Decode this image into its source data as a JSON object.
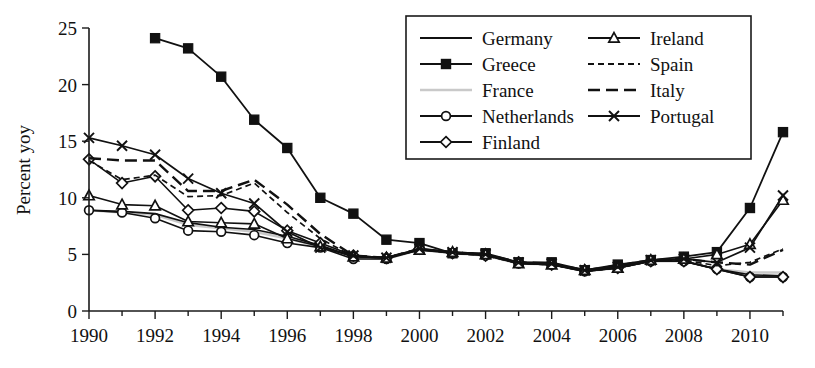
{
  "chart_data": {
    "type": "line",
    "title": "",
    "xlabel": "",
    "ylabel": "Percent yoy",
    "xlim": [
      1990,
      2011
    ],
    "ylim": [
      0,
      25
    ],
    "ytick_step": 5,
    "yticks": [
      0,
      5,
      10,
      15,
      20,
      25
    ],
    "ytick_labels": [
      "0",
      "5",
      "10",
      "15",
      "20",
      "25"
    ],
    "xticks": [
      1990,
      1992,
      1994,
      1996,
      1998,
      2000,
      2002,
      2004,
      2006,
      2008,
      2010
    ],
    "xtick_labels": [
      "1990",
      "1992",
      "1994",
      "1996",
      "1998",
      "2000",
      "2002",
      "2004",
      "2006",
      "2008",
      "2010"
    ],
    "x_minor_ticks": [
      1991,
      1993,
      1995,
      1997,
      1999,
      2001,
      2003,
      2005,
      2007,
      2009,
      2011
    ],
    "grid": false,
    "legend_position": "top-right",
    "x": [
      1990,
      1991,
      1992,
      1993,
      1994,
      1995,
      1996,
      1997,
      1998,
      1999,
      2000,
      2001,
      2002,
      2003,
      2004,
      2005,
      2006,
      2007,
      2008,
      2009,
      2010,
      2011
    ],
    "series": [
      {
        "name": "Germany",
        "marker": "none",
        "dash": "none",
        "color": "#111111",
        "width": 1.7,
        "x": [
          1990,
          1991,
          1992,
          1993,
          1994,
          1995,
          1996,
          1997,
          1998,
          1999,
          2000,
          2001,
          2002,
          2003,
          2004,
          2005,
          2006,
          2007,
          2008,
          2009,
          2010,
          2011
        ],
        "values": [
          8.9,
          8.8,
          8.6,
          7.8,
          7.4,
          7.2,
          6.6,
          5.8,
          4.8,
          4.7,
          5.4,
          5.2,
          5.0,
          4.2,
          4.1,
          3.5,
          3.8,
          4.4,
          4.4,
          3.7,
          3.2,
          3.1
        ]
      },
      {
        "name": "Greece",
        "marker": "square",
        "dash": "none",
        "color": "#111111",
        "width": 1.8,
        "x": [
          1992,
          1993,
          1994,
          1995,
          1996,
          1997,
          1998,
          1999,
          2000,
          2001,
          2002,
          2003,
          2004,
          2005,
          2006,
          2007,
          2008,
          2009,
          2010,
          2011
        ],
        "values": [
          24.1,
          23.2,
          20.7,
          16.9,
          14.4,
          10.0,
          8.6,
          6.3,
          6.0,
          5.1,
          5.1,
          4.3,
          4.3,
          3.6,
          4.1,
          4.5,
          4.8,
          5.2,
          9.1,
          15.8
        ]
      },
      {
        "name": "France",
        "marker": "none",
        "dash": "none",
        "color": "#c9c9c9",
        "width": 2.4,
        "x": [
          1990,
          1991,
          1992,
          1993,
          1994,
          1995,
          1996,
          1997,
          1998,
          1999,
          2000,
          2001,
          2002,
          2003,
          2004,
          2005,
          2006,
          2007,
          2008,
          2009,
          2010,
          2011
        ],
        "values": [
          8.9,
          8.7,
          8.5,
          7.6,
          7.3,
          7.0,
          6.4,
          5.7,
          4.7,
          4.6,
          5.4,
          5.1,
          4.9,
          4.2,
          4.1,
          3.5,
          3.8,
          4.4,
          4.4,
          3.7,
          3.4,
          3.4
        ]
      },
      {
        "name": "Netherlands",
        "marker": "circle",
        "dash": "none",
        "color": "#111111",
        "width": 1.6,
        "x": [
          1990,
          1991,
          1992,
          1993,
          1994,
          1995,
          1996,
          1997,
          1998,
          1999,
          2000,
          2001,
          2002,
          2003,
          2004,
          2005,
          2006,
          2007,
          2008,
          2009,
          2010,
          2011
        ],
        "values": [
          8.9,
          8.7,
          8.2,
          7.1,
          7.0,
          6.7,
          6.0,
          5.6,
          4.6,
          4.6,
          5.4,
          5.1,
          4.9,
          4.2,
          4.1,
          3.5,
          3.8,
          4.4,
          4.4,
          3.7,
          3.0,
          3.0
        ]
      },
      {
        "name": "Finland",
        "marker": "diamond",
        "dash": "none",
        "color": "#111111",
        "width": 1.6,
        "x": [
          1990,
          1991,
          1992,
          1993,
          1994,
          1995,
          1996,
          1997,
          1998,
          1999,
          2000,
          2001,
          2002,
          2003,
          2004,
          2005,
          2006,
          2007,
          2008,
          2009,
          2010,
          2011
        ],
        "values": [
          13.4,
          11.3,
          11.9,
          8.9,
          9.1,
          8.8,
          7.1,
          6.0,
          4.9,
          4.7,
          5.5,
          5.1,
          4.9,
          4.3,
          4.1,
          3.6,
          3.8,
          4.4,
          4.4,
          3.7,
          3.0,
          3.0
        ]
      },
      {
        "name": "Ireland",
        "marker": "triangle",
        "dash": "none",
        "color": "#111111",
        "width": 1.6,
        "x": [
          1990,
          1991,
          1992,
          1993,
          1994,
          1995,
          1996,
          1997,
          1998,
          1999,
          2000,
          2001,
          2002,
          2003,
          2004,
          2005,
          2006,
          2007,
          2008,
          2009,
          2010,
          2011
        ],
        "values": [
          10.2,
          9.4,
          9.3,
          7.9,
          7.8,
          7.7,
          6.4,
          5.7,
          4.8,
          4.7,
          5.4,
          5.2,
          5.0,
          4.2,
          4.1,
          3.6,
          3.8,
          4.5,
          4.6,
          5.0,
          5.9,
          9.8
        ]
      },
      {
        "name": "Spain",
        "marker": "none",
        "dash": "short",
        "color": "#111111",
        "width": 1.7,
        "x": [
          1990,
          1991,
          1992,
          1993,
          1994,
          1995,
          1996,
          1997,
          1998,
          1999,
          2000,
          2001,
          2002,
          2003,
          2004,
          2005,
          2006,
          2007,
          2008,
          2009,
          2010,
          2011
        ],
        "values": [
          13.3,
          11.6,
          12.0,
          10.1,
          10.2,
          11.3,
          8.7,
          6.4,
          4.8,
          4.7,
          5.5,
          5.1,
          4.9,
          4.2,
          4.1,
          3.5,
          3.8,
          4.4,
          4.5,
          4.0,
          4.3,
          5.5
        ]
      },
      {
        "name": "Italy",
        "marker": "none",
        "dash": "long",
        "color": "#111111",
        "width": 2.4,
        "x": [
          1990,
          1991,
          1992,
          1993,
          1994,
          1995,
          1996,
          1997,
          1998,
          1999,
          2000,
          2001,
          2002,
          2003,
          2004,
          2005,
          2006,
          2007,
          2008,
          2009,
          2010,
          2011
        ],
        "values": [
          13.5,
          13.3,
          13.3,
          10.6,
          10.6,
          11.6,
          9.4,
          6.8,
          4.9,
          4.7,
          5.5,
          5.2,
          5.0,
          4.3,
          4.2,
          3.6,
          4.0,
          4.5,
          4.6,
          4.3,
          4.1,
          5.4
        ]
      },
      {
        "name": "Portugal",
        "marker": "cross",
        "dash": "none",
        "color": "#111111",
        "width": 1.7,
        "x": [
          1990,
          1991,
          1992,
          1993,
          1994,
          1995,
          1996,
          1997,
          1998,
          1999,
          2000,
          2001,
          2002,
          2003,
          2004,
          2005,
          2006,
          2007,
          2008,
          2009,
          2010,
          2011
        ],
        "values": [
          15.3,
          14.6,
          13.8,
          11.7,
          10.4,
          9.5,
          7.0,
          5.6,
          4.9,
          4.7,
          5.5,
          5.2,
          5.0,
          4.3,
          4.2,
          3.6,
          3.9,
          4.5,
          4.6,
          4.3,
          5.6,
          10.2
        ]
      }
    ],
    "legend": [
      {
        "label": "Germany",
        "marker": "none",
        "dash": "none",
        "color": "#111111",
        "column": 0
      },
      {
        "label": "Greece",
        "marker": "square",
        "dash": "none",
        "color": "#111111",
        "column": 0
      },
      {
        "label": "France",
        "marker": "none",
        "dash": "none",
        "color": "#c9c9c9",
        "column": 0
      },
      {
        "label": "Netherlands",
        "marker": "circle",
        "dash": "none",
        "color": "#111111",
        "column": 0
      },
      {
        "label": "Finland",
        "marker": "diamond",
        "dash": "none",
        "color": "#111111",
        "column": 0
      },
      {
        "label": "Ireland",
        "marker": "triangle",
        "dash": "none",
        "color": "#111111",
        "column": 1
      },
      {
        "label": "Spain",
        "marker": "none",
        "dash": "short",
        "color": "#111111",
        "column": 1
      },
      {
        "label": "Italy",
        "marker": "none",
        "dash": "long",
        "color": "#111111",
        "column": 1
      },
      {
        "label": "Portugal",
        "marker": "cross",
        "dash": "none",
        "color": "#111111",
        "column": 1
      }
    ]
  }
}
